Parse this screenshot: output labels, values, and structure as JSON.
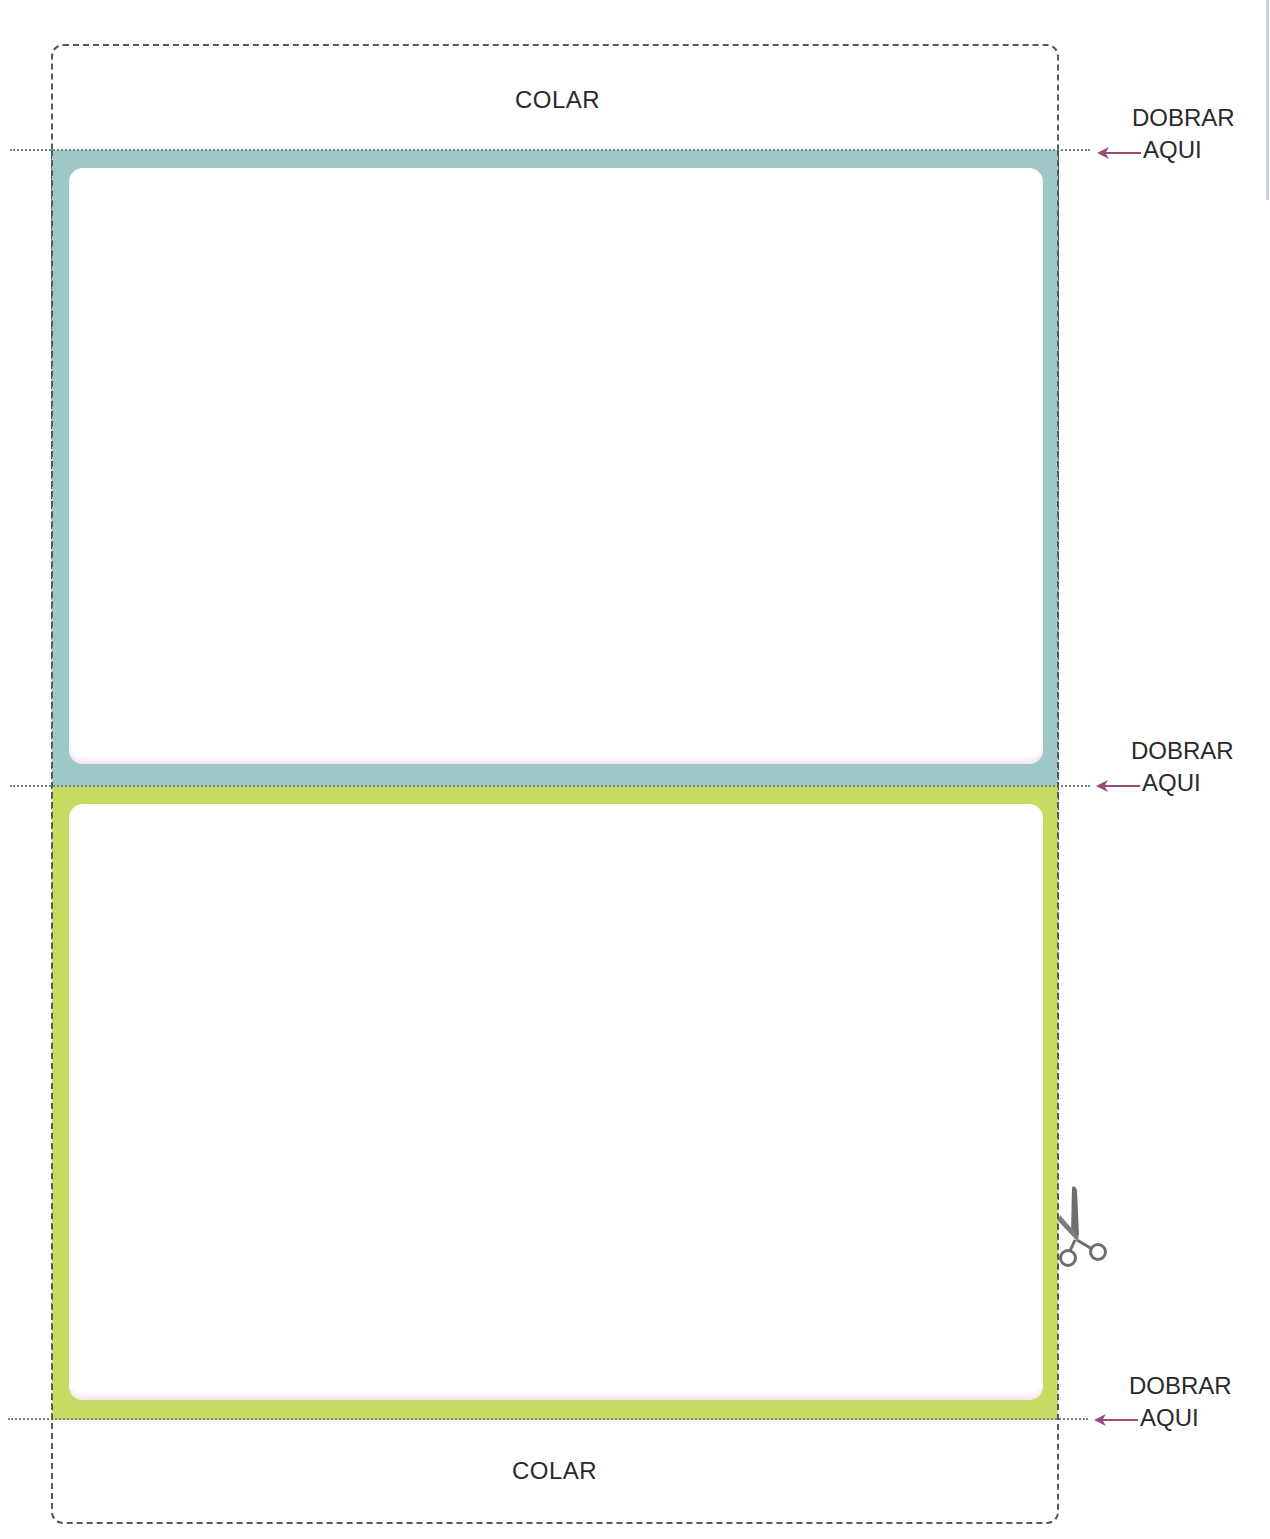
{
  "template": {
    "top_flap": {
      "label": "COLAR"
    },
    "bottom_flap": {
      "label": "COLAR"
    },
    "fold_marks": [
      {
        "line1": "DOBRAR",
        "line2": "AQUI",
        "icon": "arrow-left-icon"
      },
      {
        "line1": "DOBRAR",
        "line2": "AQUI",
        "icon": "arrow-left-icon"
      },
      {
        "line1": "DOBRAR",
        "line2": "AQUI",
        "icon": "arrow-left-icon"
      }
    ],
    "panels": [
      {
        "name": "panel-blue",
        "color": "#9ec8c8"
      },
      {
        "name": "panel-green",
        "color": "#c6db62"
      }
    ],
    "cut_icon": "scissors-icon"
  },
  "colors": {
    "arrow": "#9b4a7c",
    "dash": "#555a5e",
    "text": "#2a2a2a"
  }
}
